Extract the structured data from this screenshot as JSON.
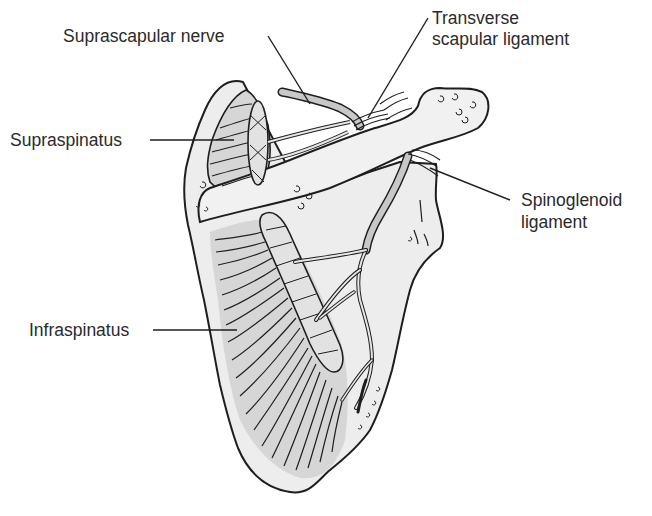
{
  "figure": {
    "colors": {
      "background": "#ffffff",
      "bone": "#ededed",
      "muscle": "#d6d6d6",
      "nerve": "#c8c8c8",
      "outline": "#1e1e1e",
      "label_text": "#2a2a2a"
    }
  },
  "labels": {
    "suprascapular_nerve": "Suprascapular nerve",
    "transverse_line1": "Transverse",
    "transverse_line2": "scapular ligament",
    "supraspinatus": "Supraspinatus",
    "spinoglenoid_line1": "Spinoglenoid",
    "spinoglenoid_line2": "ligament",
    "infraspinatus": "Infraspinatus"
  }
}
